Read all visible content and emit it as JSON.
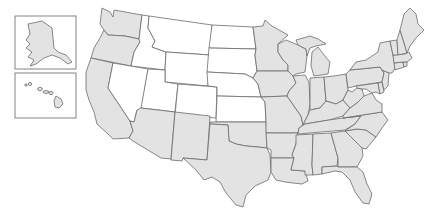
{
  "map": {
    "type": "us-states-choropleth",
    "title_partial": "",
    "colors": {
      "highlighted": "#e3e3e3",
      "not_highlighted": "#ffffff",
      "border": "#6b6b6b",
      "inset_border": "#777777"
    },
    "insets": [
      {
        "name": "Alaska",
        "category": "highlighted"
      },
      {
        "name": "Hawaii",
        "category": "highlighted"
      }
    ],
    "white_states": [
      "Montana",
      "Idaho",
      "Wyoming",
      "Nevada",
      "Utah",
      "Colorado",
      "North Dakota",
      "South Dakota",
      "Nebraska",
      "Kansas"
    ],
    "gray_states": [
      "Washington",
      "Oregon",
      "California",
      "Arizona",
      "New Mexico",
      "Texas",
      "Oklahoma",
      "Minnesota",
      "Iowa",
      "Missouri",
      "Arkansas",
      "Louisiana",
      "Wisconsin",
      "Illinois",
      "Michigan",
      "Indiana",
      "Ohio",
      "Kentucky",
      "Tennessee",
      "Mississippi",
      "Alabama",
      "Georgia",
      "Florida",
      "South Carolina",
      "North Carolina",
      "Virginia",
      "West Virginia",
      "Maryland",
      "Delaware",
      "New Jersey",
      "Pennsylvania",
      "New York",
      "Connecticut",
      "Rhode Island",
      "Massachusetts",
      "Vermont",
      "New Hampshire",
      "Maine",
      "Alaska",
      "Hawaii"
    ]
  }
}
